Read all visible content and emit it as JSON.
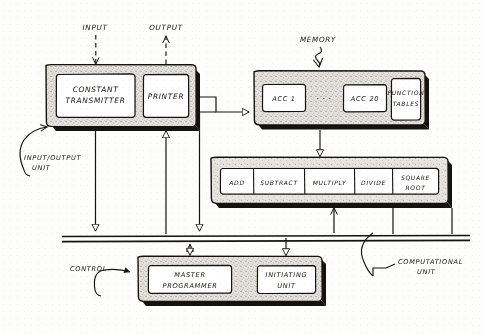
{
  "diagram": {
    "style": "hand-drawn pencil sketch on paper",
    "flow_labels": {
      "input": "INPUT",
      "output": "OUTPUT",
      "memory": "MEMORY"
    },
    "annotations": {
      "io_unit": "INPUT/OUTPUT\nUNIT",
      "io_unit_line1": "INPUT/OUTPUT",
      "io_unit_line2": "UNIT",
      "control": "CONTROL",
      "computational_unit_line1": "COMPUTATIONAL",
      "computational_unit_line2": "UNIT"
    },
    "units": [
      {
        "id": "io-unit",
        "name": "INPUT/OUTPUT UNIT",
        "boxes": [
          {
            "id": "constant-transmitter",
            "line1": "CONSTANT",
            "line2": "TRANSMITTER"
          },
          {
            "id": "printer",
            "line1": "PRINTER",
            "line2": ""
          }
        ]
      },
      {
        "id": "memory-unit",
        "name": "MEMORY",
        "boxes": [
          {
            "id": "acc1",
            "line1": "ACC 1",
            "line2": ""
          },
          {
            "id": "acc-ellipsis",
            "line1": "· · ·",
            "line2": ""
          },
          {
            "id": "acc20",
            "line1": "ACC 20",
            "line2": ""
          },
          {
            "id": "function-tables",
            "line1": "FUNCTION",
            "line2": "TABLES"
          }
        ]
      },
      {
        "id": "arithmetic-unit",
        "name": "ARITHMETIC UNIT",
        "boxes": [
          {
            "id": "add",
            "line1": "ADD",
            "line2": ""
          },
          {
            "id": "subtract",
            "line1": "SUBTRACT",
            "line2": ""
          },
          {
            "id": "multiply",
            "line1": "MULTIPLY",
            "line2": ""
          },
          {
            "id": "divide",
            "line1": "DIVIDE",
            "line2": ""
          },
          {
            "id": "square-root",
            "line1": "SQUARE",
            "line2": "ROOT"
          }
        ]
      },
      {
        "id": "control-unit",
        "name": "CONTROL",
        "boxes": [
          {
            "id": "master-programmer",
            "line1": "MASTER",
            "line2": "PROGRAMMER"
          },
          {
            "id": "initiating-unit",
            "line1": "INITIATING",
            "line2": "UNIT"
          }
        ]
      }
    ],
    "colors": {
      "ink": "#15130f",
      "paper": "#fdfdfc",
      "box_fill": "#ffffff",
      "chassis_fill": "#d9d7d2",
      "shadow": "#15130f"
    }
  }
}
